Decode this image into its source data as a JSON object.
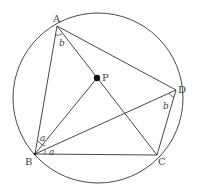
{
  "diagram": {
    "type": "geometry",
    "circle": {
      "cx": 98,
      "cy": 98,
      "r": 85
    },
    "points": {
      "A": {
        "x": 57,
        "y": 26,
        "label": "A"
      },
      "B": {
        "x": 35,
        "y": 154,
        "label": "B"
      },
      "C": {
        "x": 157,
        "y": 155,
        "label": "C"
      },
      "D": {
        "x": 176,
        "y": 90,
        "label": "D"
      },
      "P": {
        "x": 97,
        "y": 78,
        "label": "P"
      }
    },
    "segments": [
      [
        "A",
        "B"
      ],
      [
        "A",
        "D"
      ],
      [
        "A",
        "C"
      ],
      [
        "B",
        "C"
      ],
      [
        "C",
        "D"
      ],
      [
        "B",
        "D"
      ],
      [
        "B",
        "P"
      ]
    ],
    "angle_labels": {
      "a_upper": "a",
      "a_lower": "a",
      "b_at_A": "b",
      "b_at_D": "b"
    },
    "colors": {
      "stroke": "#333333",
      "text": "#444444",
      "background": "#ffffff"
    }
  }
}
